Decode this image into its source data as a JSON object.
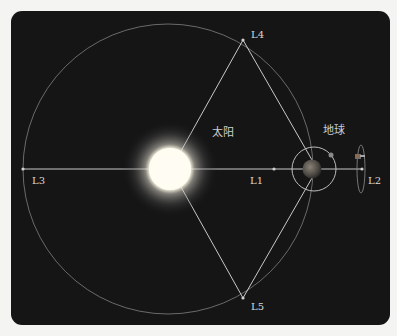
{
  "diagram": {
    "type": "lagrange-points",
    "colors": {
      "background": "#151515",
      "page": "#f4f4f2",
      "lines": "#c9c9c9",
      "sun": "#fffdf0",
      "earth": "#6a6258"
    },
    "bodies": {
      "sun": {
        "label": "太阳"
      },
      "earth": {
        "label": "地球"
      }
    },
    "points": [
      {
        "id": "L1",
        "label": "L1"
      },
      {
        "id": "L2",
        "label": "L2"
      },
      {
        "id": "L3",
        "label": "L3"
      },
      {
        "id": "L4",
        "label": "L4"
      },
      {
        "id": "L5",
        "label": "L5"
      }
    ]
  }
}
